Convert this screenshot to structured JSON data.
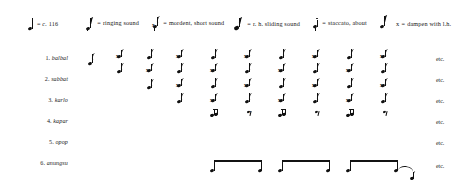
{
  "figure": {
    "kind": "music-notation-figure"
  },
  "legend": {
    "items": [
      {
        "id": "tempo",
        "symbol": "quarter-note",
        "text": "= c. 116",
        "italic_prefix": "c.",
        "x": 28,
        "text_x": 13
      },
      {
        "id": "ringing",
        "symbol": "eighth-note-ringing",
        "text": "= ringing sound",
        "x": 84,
        "text_x": 13
      },
      {
        "id": "mordent",
        "symbol": "eighth-note-mordent",
        "text": "= mordent, short sound",
        "x": 150,
        "text_x": 13
      },
      {
        "id": "sliding",
        "symbol": "eighth-note-slide",
        "text": "= r. h.  sliding  sound",
        "x": 232,
        "text_x": 13
      },
      {
        "id": "staccato",
        "symbol": "eighth-note-staccato",
        "text": "= staccato, about",
        "x": 311,
        "text_x": 13
      },
      {
        "id": "about",
        "symbol": "eighth-note-flagged",
        "text": "",
        "x": 378,
        "text_x": 0
      },
      {
        "id": "dampen",
        "symbol": "x-mark",
        "text": "= dampen with l.h.",
        "x": 394,
        "text_x": 11
      }
    ],
    "tempo_value": "116",
    "tempo_prefix": "c.",
    "ringing_label": "ringing sound",
    "mordent_label": "mordent, short sound",
    "sliding_label": "r. h.  sliding  sound",
    "staccato_label": "staccato, about",
    "dampen_label": "dampen with l.h.",
    "dampen_symbol": "x"
  },
  "rows": [
    {
      "num": "1.",
      "name": "balbal",
      "etc": "etc.",
      "y": 57
    },
    {
      "num": "2.",
      "name": "sabbat",
      "etc": "etc.",
      "y": 78
    },
    {
      "num": "3.",
      "name": "karlo",
      "etc": "etc.",
      "y": 99
    },
    {
      "num": "4.",
      "name": "kapar",
      "etc": "etc.",
      "y": 120
    },
    {
      "num": "5.",
      "name": "opop",
      "etc": "etc.",
      "y": 141
    },
    {
      "num": "6.",
      "name": "anungsu",
      "etc": "etc.",
      "y": 162
    }
  ],
  "columns": {
    "x_positions": [
      92,
      120,
      150,
      180,
      214,
      248,
      282,
      316,
      350,
      384
    ],
    "count": 10
  },
  "colors": {
    "ink": "#101010",
    "text": "#1b1b1b",
    "page": "#ffffff"
  }
}
